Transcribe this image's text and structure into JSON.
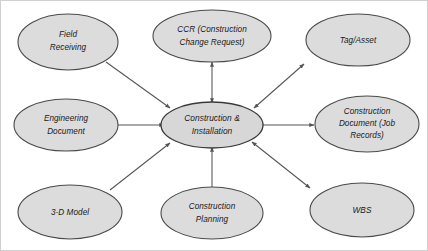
{
  "diagram": {
    "colors": {
      "node_fill": "#dcdcdc",
      "node_stroke": "#4a4a4a",
      "connector": "#555555",
      "background": "#ffffff",
      "frame": "#d0d0d0"
    },
    "center": {
      "id": "construction-installation",
      "line1": "Construction &",
      "line2": "Installation"
    },
    "nodes": [
      {
        "id": "field-receiving",
        "line1": "Field",
        "line2": "Receiving",
        "line3": "",
        "position": "top-left"
      },
      {
        "id": "ccr",
        "line1": "CCR  (Construction",
        "line2": "Change Request)",
        "line3": "",
        "position": "top-center"
      },
      {
        "id": "tag-asset",
        "line1": "Tag/Asset",
        "line2": "",
        "line3": "",
        "position": "top-right"
      },
      {
        "id": "engineering-document",
        "line1": "Engineering",
        "line2": "Document",
        "line3": "",
        "position": "middle-left"
      },
      {
        "id": "construction-document",
        "line1": "Construction",
        "line2": "Document (Job",
        "line3": "Records)",
        "position": "middle-right"
      },
      {
        "id": "three-d-model",
        "line1": "3-D Model",
        "line2": "",
        "line3": "",
        "position": "bottom-left"
      },
      {
        "id": "construction-planning",
        "line1": "Construction",
        "line2": "Planning",
        "line3": "",
        "position": "bottom-center"
      },
      {
        "id": "wbs",
        "line1": "WBS",
        "line2": "",
        "line3": "",
        "position": "bottom-right"
      }
    ],
    "connections": [
      {
        "id": "field-receiving-to-center",
        "from": "field-receiving",
        "to": "construction-installation",
        "direction": "one-way"
      },
      {
        "id": "ccr-to-center",
        "from": "ccr",
        "to": "construction-installation",
        "direction": "bidirectional"
      },
      {
        "id": "center-to-tag-asset",
        "from": "construction-installation",
        "to": "tag-asset",
        "direction": "bidirectional"
      },
      {
        "id": "engineering-document-to-center",
        "from": "engineering-document",
        "to": "construction-installation",
        "direction": "one-way"
      },
      {
        "id": "center-to-construction-document",
        "from": "construction-installation",
        "to": "construction-document",
        "direction": "one-way"
      },
      {
        "id": "three-d-model-to-center",
        "from": "three-d-model",
        "to": "construction-installation",
        "direction": "one-way"
      },
      {
        "id": "construction-planning-to-center",
        "from": "construction-planning",
        "to": "construction-installation",
        "direction": "one-way"
      },
      {
        "id": "center-to-wbs",
        "from": "construction-installation",
        "to": "wbs",
        "direction": "bidirectional"
      }
    ]
  }
}
